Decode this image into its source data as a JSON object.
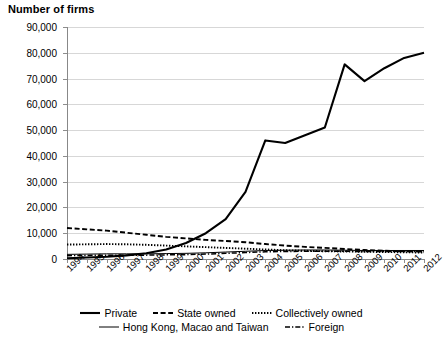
{
  "chart_data": {
    "type": "line",
    "title": "Number of firms",
    "xlabel": "",
    "ylabel": "Number of firms",
    "ylim": [
      0,
      90000
    ],
    "ytick_step": 10000,
    "grid": true,
    "legend_position": "bottom",
    "categories": [
      "1994",
      "1995",
      "1996",
      "1997",
      "1998",
      "1999",
      "2000",
      "2001",
      "2002",
      "2003",
      "2004",
      "2005",
      "2006",
      "2007",
      "2008",
      "2009",
      "2010",
      "2011",
      "2012"
    ],
    "ytick_labels": [
      "90,000",
      "80,000",
      "70,000",
      "60,000",
      "50,000",
      "40,000",
      "30,000",
      "20,000",
      "10,000",
      "0"
    ],
    "series": [
      {
        "name": "Private",
        "style": "solid-thick",
        "values": [
          300,
          600,
          900,
          1400,
          2200,
          3700,
          6200,
          10000,
          15500,
          26000,
          46000,
          45000,
          48000,
          51000,
          75500,
          69000,
          74000,
          78000,
          80000
        ]
      },
      {
        "name": "State owned",
        "style": "dashed",
        "values": [
          12000,
          11500,
          11000,
          10200,
          9400,
          8600,
          8000,
          7400,
          7000,
          6500,
          5800,
          5200,
          4700,
          4300,
          3900,
          3500,
          3200,
          3000,
          2900
        ]
      },
      {
        "name": "Collectively owned",
        "style": "dotted",
        "values": [
          5600,
          5700,
          5800,
          5700,
          5500,
          5200,
          4900,
          4600,
          4300,
          4000,
          3700,
          3400,
          3200,
          3000,
          2900,
          2800,
          2700,
          2600,
          2500
        ]
      },
      {
        "name": "Hong Kong, Macao and Taiwan",
        "style": "solid-thin",
        "values": [
          1800,
          1900,
          2000,
          2000,
          2000,
          2100,
          2200,
          2400,
          2700,
          3000,
          3300,
          3400,
          3500,
          3500,
          3400,
          3300,
          3300,
          3300,
          3300
        ]
      },
      {
        "name": "Foreign",
        "style": "dash-dot",
        "values": [
          1300,
          1400,
          1500,
          1500,
          1500,
          1600,
          1700,
          1900,
          2200,
          2500,
          2800,
          2900,
          3000,
          3000,
          3000,
          2900,
          2900,
          2900,
          2900
        ]
      }
    ]
  }
}
